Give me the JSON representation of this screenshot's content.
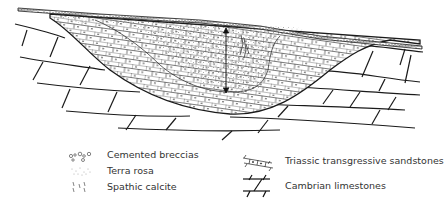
{
  "diagram": {
    "type": "geological-cross-section",
    "annotation": {
      "arrow": "vertical double-headed arrow indicating infill thickness"
    }
  },
  "legend": {
    "items": [
      {
        "id": "cemented-breccias",
        "label": "Cemented breccias",
        "symbol": "small open rounded clasts"
      },
      {
        "id": "terra-rosa",
        "label": "Terra rosa",
        "symbol": "fine stipple dots"
      },
      {
        "id": "spathic-calcite",
        "label": "Spathic calcite",
        "symbol": "small tick crystals"
      },
      {
        "id": "triassic-sandstones",
        "label": "Triassic transgressive sandstones",
        "symbol": "brick blocks with dots"
      },
      {
        "id": "cambrian-limestones",
        "label": "Cambrian limestones",
        "symbol": "large brick blocks"
      }
    ]
  },
  "colors": {
    "line": "#1a1a1a",
    "text": "#333333",
    "background": "#ffffff"
  }
}
